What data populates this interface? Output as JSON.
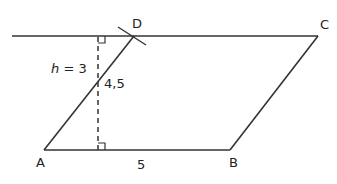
{
  "diagram": {
    "type": "parallelogram-construction",
    "stroke_color": "#333333",
    "background": "#ffffff",
    "points": {
      "A": {
        "label": "A",
        "x": 44,
        "y": 150
      },
      "B": {
        "label": "B",
        "x": 230,
        "y": 150
      },
      "C": {
        "label": "C",
        "x": 318,
        "y": 36
      },
      "D": {
        "label": "D",
        "x": 134,
        "y": 36
      }
    },
    "labels": {
      "A": "A",
      "B": "B",
      "C": "C",
      "D": "D",
      "height_var": "h",
      "height_eq": " = 3",
      "side_AD": "4,5",
      "side_AB": "5"
    },
    "measurements": {
      "h": 3,
      "AD": 4.5,
      "AB": 5
    }
  }
}
